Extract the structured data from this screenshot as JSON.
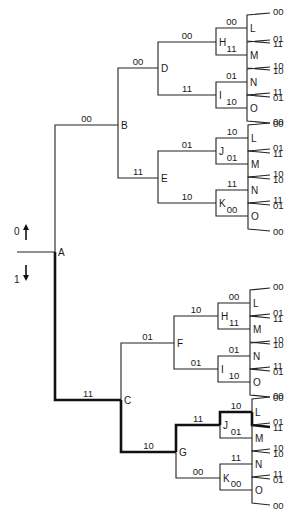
{
  "diagram": {
    "type": "trellis-decision-tree",
    "axis_legend": {
      "up": {
        "label": "0",
        "arrow": "up"
      },
      "down": {
        "label": "1",
        "arrow": "down"
      }
    },
    "colors": {
      "line": "#222222",
      "highlight": "#111111",
      "background": "#ffffff"
    },
    "root": {
      "id": "A",
      "x": 55,
      "y": 252,
      "stub_x": 17
    },
    "nodes": [
      {
        "id": "A-B",
        "label": "B",
        "parent": "A",
        "x": 118,
        "y": 125,
        "edge_label": "00",
        "bold": false
      },
      {
        "id": "A-C",
        "label": "C",
        "parent": "A",
        "x": 121,
        "y": 400,
        "edge_label": "11",
        "bold": true
      },
      {
        "id": "B-D",
        "label": "D",
        "parent": "A-B",
        "x": 158,
        "y": 68,
        "edge_label": "00",
        "bold": false
      },
      {
        "id": "B-E",
        "label": "E",
        "parent": "A-B",
        "x": 158,
        "y": 178,
        "edge_label": "11",
        "bold": false
      },
      {
        "id": "C-F",
        "label": "F",
        "parent": "A-C",
        "x": 174,
        "y": 343,
        "edge_label": "01",
        "bold": false
      },
      {
        "id": "C-G",
        "label": "G",
        "parent": "A-C",
        "x": 176,
        "y": 452,
        "edge_label": "10",
        "bold": true
      },
      {
        "id": "D-H",
        "label": "H",
        "parent": "B-D",
        "x": 216,
        "y": 42,
        "edge_label": "00",
        "bold": false
      },
      {
        "id": "D-I",
        "label": "I",
        "parent": "B-D",
        "x": 216,
        "y": 95,
        "edge_label": "11",
        "bold": false
      },
      {
        "id": "E-J",
        "label": "J",
        "parent": "B-E",
        "x": 216,
        "y": 151,
        "edge_label": "01",
        "bold": false
      },
      {
        "id": "E-K",
        "label": "K",
        "parent": "B-E",
        "x": 216,
        "y": 203,
        "edge_label": "10",
        "bold": false
      },
      {
        "id": "F-H",
        "label": "H",
        "parent": "C-F",
        "x": 218,
        "y": 316,
        "edge_label": "10",
        "bold": false
      },
      {
        "id": "F-I",
        "label": "I",
        "parent": "C-F",
        "x": 218,
        "y": 369,
        "edge_label": "01",
        "bold": false
      },
      {
        "id": "G-J",
        "label": "J",
        "parent": "C-G",
        "x": 220,
        "y": 425,
        "edge_label": "11",
        "bold": true
      },
      {
        "id": "G-K",
        "label": "K",
        "parent": "C-G",
        "x": 220,
        "y": 478,
        "edge_label": "00",
        "bold": false
      },
      {
        "id": "DH-L",
        "label": "L",
        "parent": "D-H",
        "x": 247,
        "y": 28,
        "edge_label": "00",
        "bold": false
      },
      {
        "id": "DH-M",
        "label": "M",
        "parent": "D-H",
        "x": 247,
        "y": 55,
        "edge_label": "11",
        "bold": false
      },
      {
        "id": "DI-N",
        "label": "N",
        "parent": "D-I",
        "x": 247,
        "y": 82,
        "edge_label": "01",
        "bold": false
      },
      {
        "id": "DI-O",
        "label": "O",
        "parent": "D-I",
        "x": 247,
        "y": 108,
        "edge_label": "10",
        "bold": false
      },
      {
        "id": "EJ-L",
        "label": "L",
        "parent": "E-J",
        "x": 248,
        "y": 138,
        "edge_label": "10",
        "bold": false
      },
      {
        "id": "EJ-M",
        "label": "M",
        "parent": "E-J",
        "x": 248,
        "y": 164,
        "edge_label": "01",
        "bold": false
      },
      {
        "id": "EK-N",
        "label": "N",
        "parent": "E-K",
        "x": 248,
        "y": 190,
        "edge_label": "11",
        "bold": false
      },
      {
        "id": "EK-O",
        "label": "O",
        "parent": "E-K",
        "x": 248,
        "y": 216,
        "edge_label": "00",
        "bold": false
      },
      {
        "id": "FH-L",
        "label": "L",
        "parent": "F-H",
        "x": 250,
        "y": 303,
        "edge_label": "00",
        "bold": false
      },
      {
        "id": "FH-M",
        "label": "M",
        "parent": "F-H",
        "x": 250,
        "y": 329,
        "edge_label": "11",
        "bold": false
      },
      {
        "id": "FI-N",
        "label": "N",
        "parent": "F-I",
        "x": 250,
        "y": 356,
        "edge_label": "01",
        "bold": false
      },
      {
        "id": "FI-O",
        "label": "O",
        "parent": "F-I",
        "x": 250,
        "y": 382,
        "edge_label": "10",
        "bold": false
      },
      {
        "id": "GJ-L",
        "label": "L",
        "parent": "G-J",
        "x": 252,
        "y": 412,
        "edge_label": "10",
        "bold": true
      },
      {
        "id": "GJ-M",
        "label": "M",
        "parent": "G-J",
        "x": 252,
        "y": 438,
        "edge_label": "01",
        "bold": false
      },
      {
        "id": "GK-N",
        "label": "N",
        "parent": "G-K",
        "x": 252,
        "y": 464,
        "edge_label": "11",
        "bold": false
      },
      {
        "id": "GK-O",
        "label": "O",
        "parent": "G-K",
        "x": 252,
        "y": 490,
        "edge_label": "00",
        "bold": false
      }
    ],
    "leaves": [
      {
        "parent": "DH-L",
        "labels": [
          "00",
          "11"
        ],
        "bold": [
          false,
          false
        ]
      },
      {
        "parent": "DH-M",
        "labels": [
          "01",
          "10"
        ],
        "bold": [
          false,
          false
        ]
      },
      {
        "parent": "DI-N",
        "labels": [
          "10",
          "01"
        ],
        "bold": [
          false,
          false
        ]
      },
      {
        "parent": "DI-O",
        "labels": [
          "11",
          "00"
        ],
        "bold": [
          false,
          false
        ]
      },
      {
        "parent": "EJ-L",
        "labels": [
          "00",
          "11"
        ],
        "bold": [
          false,
          false
        ]
      },
      {
        "parent": "EJ-M",
        "labels": [
          "01",
          "10"
        ],
        "bold": [
          false,
          false
        ]
      },
      {
        "parent": "EK-N",
        "labels": [
          "10",
          "01"
        ],
        "bold": [
          false,
          false
        ]
      },
      {
        "parent": "EK-O",
        "labels": [
          "11",
          "00"
        ],
        "bold": [
          false,
          false
        ]
      },
      {
        "parent": "FH-L",
        "labels": [
          "00",
          "11"
        ],
        "bold": [
          false,
          false
        ]
      },
      {
        "parent": "FH-M",
        "labels": [
          "01",
          "10"
        ],
        "bold": [
          false,
          false
        ]
      },
      {
        "parent": "FI-N",
        "labels": [
          "10",
          "01"
        ],
        "bold": [
          false,
          false
        ]
      },
      {
        "parent": "FI-O",
        "labels": [
          "11",
          "00"
        ],
        "bold": [
          false,
          false
        ]
      },
      {
        "parent": "GJ-L",
        "labels": [
          "00",
          "11"
        ],
        "bold": [
          false,
          true
        ]
      },
      {
        "parent": "GJ-M",
        "labels": [
          "01",
          "10"
        ],
        "bold": [
          false,
          false
        ]
      },
      {
        "parent": "GK-N",
        "labels": [
          "10",
          "01"
        ],
        "bold": [
          false,
          false
        ]
      },
      {
        "parent": "GK-O",
        "labels": [
          "11",
          "00"
        ],
        "bold": [
          false,
          false
        ]
      }
    ],
    "leaf_end_x": 270,
    "leaf_spread": 6
  }
}
